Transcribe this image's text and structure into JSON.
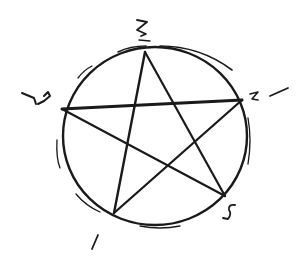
{
  "diagram": {
    "type": "pentagram-in-circle",
    "ink_color": "#1a1a1a",
    "background": "#ffffff",
    "circle": {
      "cx": 155,
      "cy": 135,
      "r": 91
    },
    "vertices": [
      {
        "id": "top",
        "x": 145,
        "y": 52,
        "label": "2"
      },
      {
        "id": "left",
        "x": 62,
        "y": 109,
        "label": "4"
      },
      {
        "id": "right",
        "x": 242,
        "y": 100,
        "label": "3"
      },
      {
        "id": "bottom-left",
        "x": 114,
        "y": 213,
        "label": "1"
      },
      {
        "id": "bottom-right",
        "x": 225,
        "y": 196,
        "label": "5"
      }
    ],
    "labels": [
      {
        "text": "2",
        "x": 136,
        "y": 18
      },
      {
        "text": "4",
        "x": 22,
        "y": 86
      },
      {
        "text": "3",
        "x": 248,
        "y": 86
      },
      {
        "text": "5",
        "x": 224,
        "y": 205
      },
      {
        "text": "1",
        "x": 90,
        "y": 232
      }
    ],
    "stroke_order": [
      "1",
      "2",
      "5",
      "4",
      "3",
      "1"
    ]
  }
}
